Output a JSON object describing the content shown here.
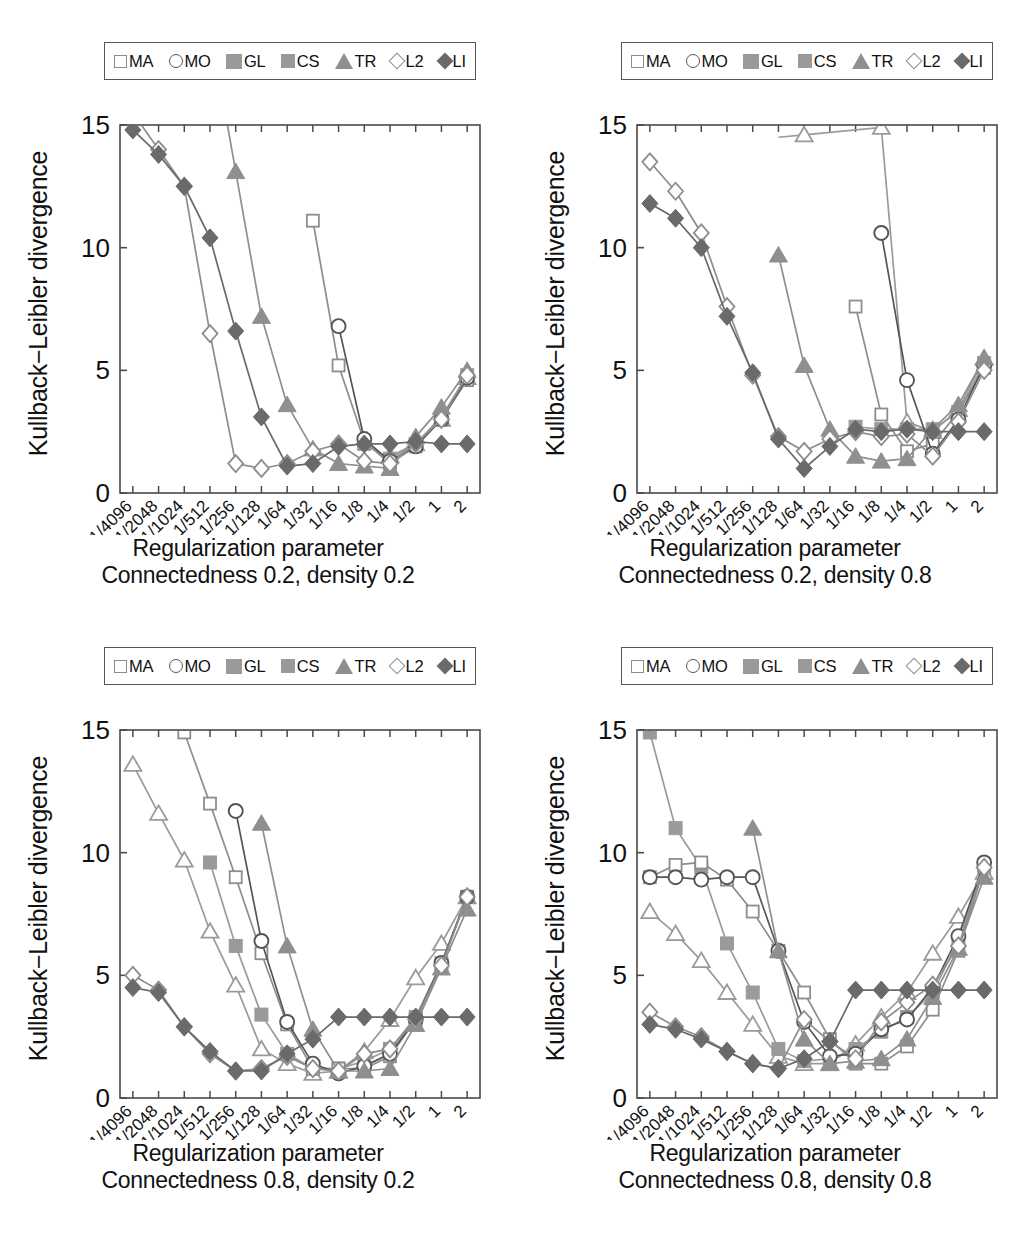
{
  "figure": {
    "ylabel": "Kullback−Leibler divergence",
    "xlabel": "Regularization parameter",
    "ytick_labels": [
      "0",
      "5",
      "10",
      "15"
    ],
    "yticks": [
      0,
      5,
      10,
      15
    ],
    "ylim": [
      0,
      15
    ],
    "xtick_labels": [
      "1/4096",
      "1/2048",
      "1/1024",
      "1/512",
      "1/256",
      "1/128",
      "1/64",
      "1/32",
      "1/16",
      "1/8",
      "1/4",
      "1/2",
      "1",
      "2"
    ],
    "legend_entries": [
      {
        "label": "MA",
        "marker": "square-open",
        "color": "#8d8d8d",
        "icon": "open-square-marker-icon"
      },
      {
        "label": "MO",
        "marker": "circle-open",
        "color": "#555555",
        "icon": "open-circle-marker-icon"
      },
      {
        "label": "GL",
        "marker": "tri-open",
        "color": "#9a9a9a",
        "icon": "open-triangle-marker-icon"
      },
      {
        "label": "CS",
        "marker": "square-fill",
        "color": "#9a9a9a",
        "icon": "filled-square-marker-icon"
      },
      {
        "label": "TR",
        "marker": "tri-fill",
        "color": "#8f8f8f",
        "icon": "filled-triangle-marker-icon"
      },
      {
        "label": "L2",
        "marker": "diamond-open",
        "color": "#8d8d8d",
        "icon": "open-diamond-marker-icon"
      },
      {
        "label": "LI",
        "marker": "diamond-fill",
        "color": "#6a6a6a",
        "icon": "filled-diamond-marker-icon"
      }
    ]
  },
  "panels": [
    {
      "id": "panel-c02-d02",
      "caption_line1": "Regularization parameter",
      "caption_line2": "Connectedness 0.2, density 0.2"
    },
    {
      "id": "panel-c02-d08",
      "caption_line1": "Regularization parameter",
      "caption_line2": "Connectedness 0.2, density 0.8"
    },
    {
      "id": "panel-c08-d02",
      "caption_line1": "Regularization parameter",
      "caption_line2": "Connectedness 0.8, density 0.2"
    },
    {
      "id": "panel-c08-d08",
      "caption_line1": "Regularization parameter",
      "caption_line2": "Connectedness 0.8, density 0.8"
    }
  ],
  "chart_data": [
    {
      "type": "line",
      "title": "Connectedness 0.2, density 0.2",
      "xlabel": "Regularization parameter",
      "ylabel": "Kullback−Leibler divergence",
      "ylim": [
        0,
        15
      ],
      "grid": false,
      "legend_position": "top-center",
      "categories": [
        "1/4096",
        "1/2048",
        "1/1024",
        "1/512",
        "1/256",
        "1/128",
        "1/64",
        "1/32",
        "1/16",
        "1/8",
        "1/4",
        "1/2",
        "1",
        "2"
      ],
      "series": [
        {
          "name": "MA",
          "marker": "square-open",
          "values": [
            null,
            null,
            null,
            null,
            null,
            null,
            null,
            11.1,
            5.2,
            2.1,
            1.2,
            1.9,
            3.0,
            4.6
          ]
        },
        {
          "name": "MO",
          "marker": "circle-open",
          "values": [
            null,
            null,
            null,
            null,
            null,
            null,
            null,
            null,
            6.8,
            2.2,
            1.3,
            1.9,
            3.0,
            4.7
          ]
        },
        {
          "name": "GL",
          "marker": "tri-open",
          "values": [
            null,
            null,
            null,
            null,
            null,
            null,
            null,
            null,
            null,
            null,
            1.5,
            2.0,
            3.0,
            4.7
          ]
        },
        {
          "name": "CS",
          "marker": "square-fill",
          "values": [
            null,
            null,
            null,
            null,
            null,
            null,
            null,
            null,
            null,
            2.0,
            1.4,
            2.0,
            3.1,
            4.8
          ]
        },
        {
          "name": "TR",
          "marker": "tri-fill",
          "values": [
            null,
            null,
            null,
            null,
            13.1,
            7.2,
            3.6,
            1.8,
            1.2,
            1.1,
            1.0,
            2.3,
            3.5,
            5.0
          ]
        },
        {
          "name": "L2",
          "marker": "diamond-open",
          "values": [
            null,
            14.0,
            12.5,
            6.5,
            1.2,
            1.0,
            1.2,
            1.7,
            2.0,
            1.3,
            1.2,
            2.0,
            3.0,
            4.8
          ]
        },
        {
          "name": "LI",
          "marker": "diamond-fill",
          "values": [
            14.8,
            13.8,
            12.5,
            10.4,
            6.6,
            3.1,
            1.1,
            1.2,
            1.9,
            2.0,
            2.0,
            2.1,
            2.0,
            2.0
          ]
        }
      ]
    },
    {
      "type": "line",
      "title": "Connectedness 0.2, density 0.8",
      "xlabel": "Regularization parameter",
      "ylabel": "Kullback−Leibler divergence",
      "ylim": [
        0,
        15
      ],
      "grid": false,
      "legend_position": "top-center",
      "categories": [
        "1/4096",
        "1/2048",
        "1/1024",
        "1/512",
        "1/256",
        "1/128",
        "1/64",
        "1/32",
        "1/16",
        "1/8",
        "1/4",
        "1/2",
        "1",
        "2"
      ],
      "series": [
        {
          "name": "MA",
          "marker": "square-open",
          "values": [
            null,
            null,
            null,
            null,
            null,
            null,
            null,
            null,
            7.6,
            3.2,
            1.7,
            2.0,
            3.3,
            5.1
          ]
        },
        {
          "name": "MO",
          "marker": "circle-open",
          "values": [
            null,
            null,
            null,
            null,
            null,
            null,
            null,
            null,
            null,
            10.6,
            4.6,
            1.6,
            3.0,
            5.2
          ]
        },
        {
          "name": "GL",
          "marker": "tri-open",
          "values": [
            null,
            null,
            null,
            null,
            null,
            null,
            14.6,
            null,
            null,
            14.9,
            2.9,
            2.5,
            3.4,
            5.5
          ]
        },
        {
          "name": "CS",
          "marker": "square-fill",
          "values": [
            null,
            null,
            null,
            null,
            null,
            null,
            null,
            null,
            2.7,
            2.6,
            2.6,
            2.6,
            3.3,
            5.3
          ]
        },
        {
          "name": "TR",
          "marker": "tri-fill",
          "values": [
            null,
            null,
            null,
            null,
            null,
            9.7,
            5.2,
            2.6,
            1.5,
            1.3,
            1.4,
            2.6,
            3.6,
            5.5
          ]
        },
        {
          "name": "L2",
          "marker": "diamond-open",
          "values": [
            13.5,
            12.3,
            10.6,
            7.6,
            4.8,
            2.3,
            1.7,
            2.2,
            2.5,
            2.3,
            2.4,
            1.5,
            2.9,
            5.0
          ]
        },
        {
          "name": "LI",
          "marker": "diamond-fill",
          "values": [
            11.8,
            11.2,
            10.0,
            7.2,
            4.9,
            2.2,
            1.0,
            1.9,
            2.6,
            2.5,
            2.6,
            2.5,
            2.5,
            2.5
          ]
        }
      ]
    },
    {
      "type": "line",
      "title": "Connectedness 0.8, density 0.2",
      "xlabel": "Regularization parameter",
      "ylabel": "Kullback−Leibler divergence",
      "ylim": [
        0,
        15
      ],
      "grid": false,
      "legend_position": "top-center",
      "categories": [
        "1/4096",
        "1/2048",
        "1/1024",
        "1/512",
        "1/256",
        "1/128",
        "1/64",
        "1/32",
        "1/16",
        "1/8",
        "1/4",
        "1/2",
        "1",
        "2"
      ],
      "series": [
        {
          "name": "MA",
          "marker": "square-open",
          "values": [
            null,
            null,
            14.9,
            12.0,
            9.0,
            5.9,
            3.0,
            1.2,
            1.2,
            1.2,
            1.7,
            3.2,
            5.4,
            8.2
          ]
        },
        {
          "name": "MO",
          "marker": "circle-open",
          "values": [
            null,
            null,
            null,
            null,
            11.7,
            6.4,
            3.1,
            1.4,
            1.0,
            1.3,
            1.8,
            3.2,
            5.5,
            8.2
          ]
        },
        {
          "name": "GL",
          "marker": "tri-open",
          "values": [
            13.6,
            11.6,
            9.7,
            6.8,
            4.6,
            2.0,
            1.4,
            1.0,
            1.1,
            1.9,
            3.2,
            4.9,
            6.3,
            8.2
          ]
        },
        {
          "name": "CS",
          "marker": "square-fill",
          "values": [
            null,
            null,
            null,
            9.6,
            6.2,
            3.4,
            1.8,
            1.2,
            1.2,
            1.5,
            2.0,
            3.3,
            5.5,
            8.2
          ]
        },
        {
          "name": "TR",
          "marker": "tri-fill",
          "values": [
            null,
            null,
            null,
            null,
            null,
            11.2,
            6.2,
            2.8,
            1.1,
            1.1,
            1.2,
            3.0,
            5.3,
            7.7
          ]
        },
        {
          "name": "L2",
          "marker": "diamond-open",
          "values": [
            5.0,
            4.4,
            2.9,
            1.8,
            1.1,
            1.2,
            1.7,
            1.2,
            1.1,
            1.8,
            2.0,
            3.2,
            5.4,
            8.2
          ]
        },
        {
          "name": "LI",
          "marker": "diamond-fill",
          "values": [
            4.5,
            4.3,
            2.9,
            1.9,
            1.1,
            1.1,
            1.8,
            2.4,
            3.3,
            3.3,
            3.3,
            3.3,
            3.3,
            3.3
          ]
        }
      ]
    },
    {
      "type": "line",
      "title": "Connectedness 0.8, density 0.8",
      "xlabel": "Regularization parameter",
      "ylabel": "Kullback−Leibler divergence",
      "ylim": [
        0,
        15
      ],
      "grid": false,
      "legend_position": "top-center",
      "categories": [
        "1/4096",
        "1/2048",
        "1/1024",
        "1/512",
        "1/256",
        "1/128",
        "1/64",
        "1/32",
        "1/16",
        "1/8",
        "1/4",
        "1/2",
        "1",
        "2"
      ],
      "series": [
        {
          "name": "MA",
          "marker": "square-open",
          "values": [
            9.0,
            9.5,
            9.6,
            8.9,
            7.6,
            6.0,
            4.3,
            2.4,
            1.4,
            1.4,
            2.1,
            3.6,
            6.0,
            9.4
          ]
        },
        {
          "name": "MO",
          "marker": "circle-open",
          "values": [
            9.0,
            9.0,
            8.9,
            9.0,
            9.0,
            6.0,
            3.1,
            1.7,
            1.8,
            2.8,
            3.2,
            4.5,
            6.6,
            9.6
          ]
        },
        {
          "name": "GL",
          "marker": "tri-open",
          "values": [
            7.6,
            6.7,
            5.6,
            4.3,
            3.0,
            1.7,
            1.4,
            1.4,
            2.2,
            3.3,
            4.3,
            5.9,
            7.4,
            9.2
          ]
        },
        {
          "name": "CS",
          "marker": "square-fill",
          "values": [
            14.9,
            11.0,
            9.4,
            6.3,
            4.3,
            2.0,
            1.5,
            1.6,
            2.0,
            2.7,
            3.3,
            4.3,
            6.4,
            9.5
          ]
        },
        {
          "name": "TR",
          "marker": "tri-fill",
          "values": [
            null,
            null,
            null,
            null,
            11.0,
            6.0,
            2.4,
            1.4,
            1.5,
            1.6,
            2.4,
            4.1,
            6.1,
            9.0
          ]
        },
        {
          "name": "L2",
          "marker": "diamond-open",
          "values": [
            3.5,
            2.9,
            2.5,
            1.9,
            1.4,
            1.2,
            3.2,
            2.3,
            1.6,
            3.1,
            3.9,
            4.6,
            6.2,
            9.4
          ]
        },
        {
          "name": "LI",
          "marker": "diamond-fill",
          "values": [
            3.0,
            2.8,
            2.4,
            1.9,
            1.4,
            1.2,
            1.6,
            2.3,
            4.4,
            4.4,
            4.4,
            4.4,
            4.4,
            4.4
          ]
        }
      ]
    }
  ]
}
